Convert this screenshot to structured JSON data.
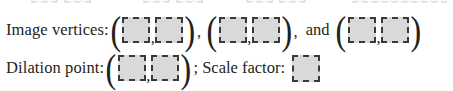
{
  "document": {
    "type": "worksheet-problem",
    "background_color": "#ffffff",
    "text_color": "#231f20",
    "answer_box": {
      "fill_color": "#d9d9d9",
      "border_color": "#3a3a3a",
      "border_style": "dashed",
      "value": ""
    }
  },
  "ghost_line": {
    "note": "faint cut-off bottom of the preceding line",
    "open_paren": "(",
    "close_paren": ")"
  },
  "rows": [
    {
      "id": "image-vertices",
      "label": "Image vertices:",
      "pairs": [
        {
          "open": "(",
          "x": "",
          "comma": ",",
          "y": "",
          "close": ")",
          "trailing": ","
        },
        {
          "open": "(",
          "x": "",
          "comma": ",",
          "y": "",
          "close": ")",
          "trailing": ","
        },
        {
          "open": "(",
          "x": "",
          "comma": ",",
          "y": "",
          "close": ")",
          "trailing": ""
        }
      ],
      "conjunction": "and"
    },
    {
      "id": "dilation-point",
      "label": "Dilation point:",
      "pairs": [
        {
          "open": "(",
          "x": "",
          "comma": ",",
          "y": "",
          "close": ")",
          "trailing": ""
        }
      ],
      "separator": ";",
      "scale_factor_label": "Scale factor:",
      "scale_factor_value": ""
    }
  ]
}
